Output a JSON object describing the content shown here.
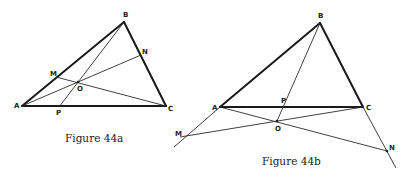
{
  "figures": [
    {
      "caption": "Figure 44a",
      "points": {
        "A": "A",
        "B": "B",
        "C": "C",
        "M": "M",
        "N": "N",
        "O": "O",
        "P": "P"
      }
    },
    {
      "caption": "Figure 44b",
      "points": {
        "A": "A",
        "B": "B",
        "C": "C",
        "M": "M",
        "N": "N",
        "O": "O",
        "P": "P"
      }
    }
  ]
}
